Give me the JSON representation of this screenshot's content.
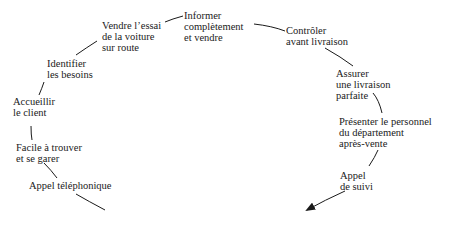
{
  "diagram": {
    "type": "customer-service-cycle",
    "steps": [
      {
        "id": "appel-telephonique",
        "lines": [
          "Appel téléphonique"
        ]
      },
      {
        "id": "facile-trouver",
        "lines": [
          "Facile à trouver",
          "et se garer"
        ]
      },
      {
        "id": "accueillir",
        "lines": [
          "Accueillir",
          "le client"
        ]
      },
      {
        "id": "identifier",
        "lines": [
          "Identifier",
          "les besoins"
        ]
      },
      {
        "id": "vendre-essai",
        "lines": [
          "Vendre l’essai",
          "de la voiture",
          "sur route"
        ]
      },
      {
        "id": "informer",
        "lines": [
          "Informer",
          "complètement",
          "et vendre"
        ]
      },
      {
        "id": "controler",
        "lines": [
          "Contrôler",
          "avant livraison"
        ]
      },
      {
        "id": "assurer",
        "lines": [
          "Assurer",
          "une livraison",
          "parfaite"
        ]
      },
      {
        "id": "presenter",
        "lines": [
          "Présenter le personnel",
          "du département",
          "après-vente"
        ]
      },
      {
        "id": "appel-suivi",
        "lines": [
          "Appel",
          "de suivi"
        ]
      }
    ],
    "colors": {
      "text": "#1a1a1a",
      "line": "#1a1a1a",
      "background": "#ffffff"
    }
  }
}
